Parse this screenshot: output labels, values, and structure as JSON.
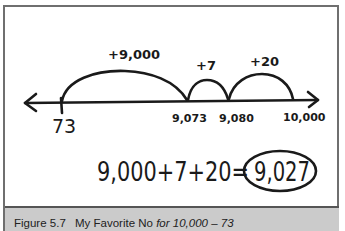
{
  "figure": {
    "number_line": {
      "points": [
        {
          "label": "73",
          "x": 62
        },
        {
          "label": "9,073",
          "x": 187
        },
        {
          "label": "9,080",
          "x": 228
        },
        {
          "label": "10,000",
          "x": 293
        }
      ],
      "jumps": [
        {
          "label": "+9,000",
          "from": "73",
          "to": "9,073"
        },
        {
          "label": "+7",
          "from": "9,073",
          "to": "9,080"
        },
        {
          "label": "+20",
          "from": "9,080",
          "to": "10,000"
        }
      ]
    },
    "equation": {
      "expression": "9,000+7+20=",
      "answer": "9,027"
    }
  },
  "caption": {
    "figure_number": "Figure 5.7",
    "title": "My Favorite No",
    "subtitle_italic": "for 10,000 – 73"
  },
  "colors": {
    "ink": "#1a1a1a",
    "border": "#6f6f6f",
    "caption_bg": "#cbcbcb"
  }
}
